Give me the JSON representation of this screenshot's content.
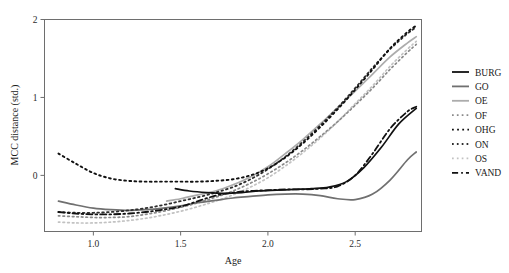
{
  "chart_data": {
    "type": "line",
    "title": "",
    "xlabel": "Age",
    "ylabel": "MCC distance (std.)",
    "xlim": [
      0.72,
      2.88
    ],
    "ylim": [
      -0.72,
      2.0
    ],
    "xticks": [
      1.0,
      1.5,
      2.0,
      2.5
    ],
    "xticklabels": [
      "1.0",
      "1.5",
      "2.0",
      "2.5"
    ],
    "yticks": [
      0,
      1,
      2
    ],
    "yticklabels": [
      "0",
      "1",
      "2"
    ],
    "grid": false,
    "legend_position": "right-outside",
    "series": [
      {
        "name": "BURG",
        "style": "solid",
        "color": "#111111",
        "width": 1.7,
        "x": [
          1.47,
          1.55,
          1.65,
          1.75,
          1.85,
          1.95,
          2.05,
          2.15,
          2.25,
          2.35,
          2.45,
          2.55,
          2.65,
          2.75,
          2.85
        ],
        "y": [
          -0.17,
          -0.2,
          -0.22,
          -0.23,
          -0.22,
          -0.2,
          -0.19,
          -0.18,
          -0.17,
          -0.15,
          -0.08,
          0.1,
          0.36,
          0.66,
          0.86
        ]
      },
      {
        "name": "GO",
        "style": "solid",
        "color": "#707070",
        "width": 1.7,
        "x": [
          0.8,
          0.9,
          1.0,
          1.1,
          1.2,
          1.3,
          1.4,
          1.5,
          1.6,
          1.7,
          1.8,
          1.9,
          2.0,
          2.1,
          2.2,
          2.3,
          2.4,
          2.5,
          2.6,
          2.7,
          2.8,
          2.85
        ],
        "y": [
          -0.33,
          -0.38,
          -0.42,
          -0.44,
          -0.45,
          -0.44,
          -0.42,
          -0.39,
          -0.35,
          -0.32,
          -0.29,
          -0.27,
          -0.25,
          -0.24,
          -0.24,
          -0.26,
          -0.3,
          -0.31,
          -0.24,
          -0.06,
          0.2,
          0.3
        ]
      },
      {
        "name": "OE",
        "style": "solid",
        "color": "#acacac",
        "width": 1.7,
        "x": [
          1.42,
          1.5,
          1.6,
          1.7,
          1.8,
          1.9,
          2.0,
          2.1,
          2.2,
          2.3,
          2.4,
          2.5,
          2.6,
          2.7,
          2.8,
          2.85
        ],
        "y": [
          -0.33,
          -0.3,
          -0.25,
          -0.2,
          -0.12,
          -0.02,
          0.11,
          0.28,
          0.46,
          0.66,
          0.87,
          1.08,
          1.3,
          1.52,
          1.7,
          1.78
        ]
      },
      {
        "name": "OF",
        "style": "dotted",
        "color": "#8a8a8a",
        "width": 1.7,
        "x": [
          0.8,
          0.9,
          1.0,
          1.1,
          1.2,
          1.3,
          1.4,
          1.5,
          1.6,
          1.7,
          1.8,
          1.9,
          2.0,
          2.1,
          2.2,
          2.3,
          2.4,
          2.5,
          2.6,
          2.7,
          2.8,
          2.85
        ],
        "y": [
          -0.52,
          -0.53,
          -0.54,
          -0.54,
          -0.53,
          -0.5,
          -0.46,
          -0.41,
          -0.35,
          -0.28,
          -0.2,
          -0.1,
          0.02,
          0.16,
          0.32,
          0.5,
          0.69,
          0.9,
          1.12,
          1.36,
          1.58,
          1.68
        ]
      },
      {
        "name": "OHG",
        "style": "dotted",
        "color": "#111111",
        "width": 1.9,
        "x": [
          0.8,
          0.9,
          1.0,
          1.1,
          1.2,
          1.3,
          1.4,
          1.5,
          1.6,
          1.7,
          1.8,
          1.9,
          2.0,
          2.1,
          2.2,
          2.3,
          2.4,
          2.5,
          2.6,
          2.7,
          2.8,
          2.85
        ],
        "y": [
          0.28,
          0.15,
          0.03,
          -0.04,
          -0.07,
          -0.08,
          -0.08,
          -0.08,
          -0.08,
          -0.07,
          -0.05,
          0.0,
          0.09,
          0.23,
          0.41,
          0.62,
          0.85,
          1.1,
          1.36,
          1.63,
          1.84,
          1.92
        ]
      },
      {
        "name": "ON",
        "style": "dotted",
        "color": "#2e2e2e",
        "width": 1.8,
        "x": [
          0.8,
          0.9,
          1.0,
          1.1,
          1.2,
          1.3,
          1.4,
          1.5,
          1.6,
          1.7,
          1.8,
          1.9,
          2.0,
          2.1,
          2.2,
          2.3,
          2.4,
          2.5,
          2.6,
          2.7,
          2.8,
          2.85
        ],
        "y": [
          -0.47,
          -0.48,
          -0.48,
          -0.47,
          -0.45,
          -0.42,
          -0.38,
          -0.33,
          -0.28,
          -0.22,
          -0.15,
          -0.05,
          0.08,
          0.24,
          0.43,
          0.64,
          0.87,
          1.12,
          1.38,
          1.62,
          1.82,
          1.9
        ]
      },
      {
        "name": "OS",
        "style": "dotted",
        "color": "#c2c2c2",
        "width": 1.7,
        "x": [
          0.8,
          0.9,
          1.0,
          1.1,
          1.2,
          1.3,
          1.4,
          1.5,
          1.6,
          1.7,
          1.8,
          1.9,
          2.0,
          2.1,
          2.2,
          2.3,
          2.4,
          2.5,
          2.6,
          2.7,
          2.8,
          2.85
        ],
        "y": [
          -0.6,
          -0.61,
          -0.61,
          -0.6,
          -0.58,
          -0.55,
          -0.51,
          -0.46,
          -0.4,
          -0.33,
          -0.25,
          -0.15,
          -0.03,
          0.12,
          0.29,
          0.48,
          0.69,
          0.92,
          1.15,
          1.4,
          1.62,
          1.72
        ]
      },
      {
        "name": "VAND",
        "style": "dashdot",
        "color": "#111111",
        "width": 1.8,
        "x": [
          0.8,
          0.9,
          1.0,
          1.1,
          1.2,
          1.3,
          1.4,
          1.5,
          1.6,
          1.7,
          1.8,
          1.9,
          2.0,
          2.1,
          2.2,
          2.3,
          2.4,
          2.5,
          2.6,
          2.7,
          2.8,
          2.85
        ],
        "y": [
          -0.47,
          -0.49,
          -0.5,
          -0.5,
          -0.49,
          -0.47,
          -0.44,
          -0.4,
          -0.33,
          -0.26,
          -0.22,
          -0.2,
          -0.19,
          -0.18,
          -0.18,
          -0.17,
          -0.14,
          0.0,
          0.28,
          0.6,
          0.82,
          0.88
        ]
      }
    ]
  },
  "legend": {
    "entries": [
      {
        "label": "BURG"
      },
      {
        "label": "GO"
      },
      {
        "label": "OE"
      },
      {
        "label": "OF"
      },
      {
        "label": "OHG"
      },
      {
        "label": "ON"
      },
      {
        "label": "OS"
      },
      {
        "label": "VAND"
      }
    ]
  }
}
